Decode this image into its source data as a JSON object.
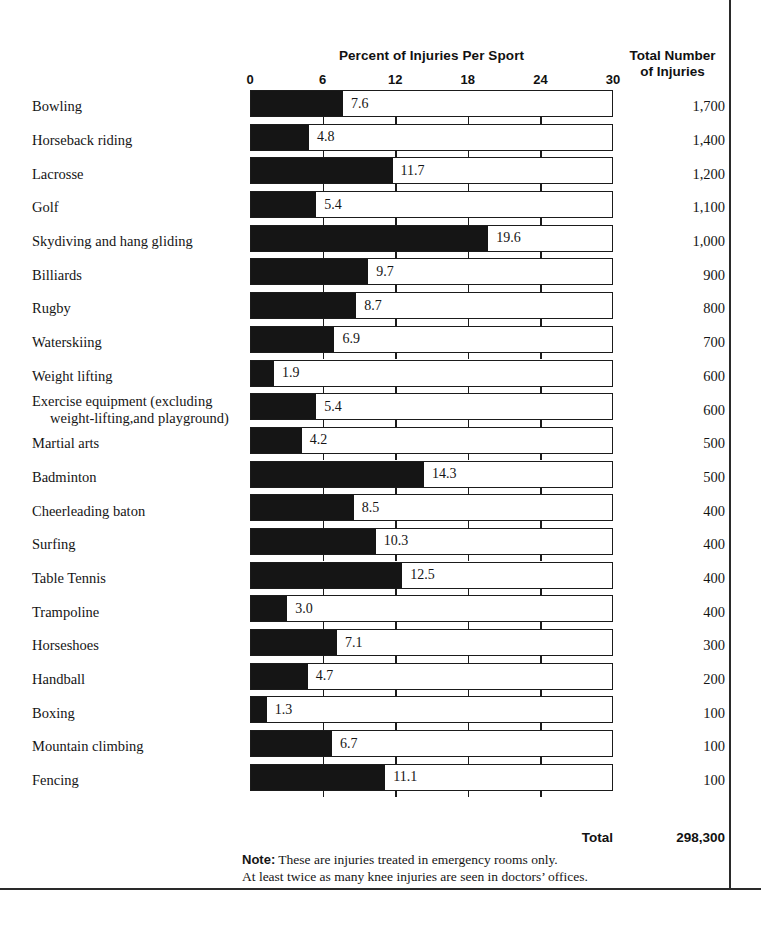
{
  "chart_data": {
    "type": "bar",
    "orientation": "horizontal",
    "title": "Percent of Injuries Per Sport",
    "xlabel": "",
    "ylabel": "",
    "xlim": [
      0,
      30
    ],
    "xticks": [
      0,
      6,
      12,
      18,
      24,
      30
    ],
    "grid": false,
    "legend": null,
    "categories": [
      "Bowling",
      "Horseback riding",
      "Lacrosse",
      "Golf",
      "Skydiving and hang gliding",
      "Billiards",
      "Rugby",
      "Waterskiing",
      "Weight  lifting",
      "Exercise equipment (excluding weight-lifting,and playground)",
      "Martial arts",
      "Badminton",
      "Cheerleading baton",
      "Surfing",
      "Table Tennis",
      "Trampoline",
      "Horseshoes",
      "Handball",
      "Boxing",
      "Mountain climbing",
      "Fencing"
    ],
    "values": [
      7.6,
      4.8,
      11.7,
      5.4,
      19.6,
      9.7,
      8.7,
      6.9,
      1.9,
      5.4,
      4.2,
      14.3,
      8.5,
      10.3,
      12.5,
      3.0,
      7.1,
      4.7,
      1.3,
      6.7,
      11.1
    ],
    "value_labels": [
      "7.6",
      "4.8",
      "11.7",
      "5.4",
      "19.6",
      "9.7",
      "8.7",
      "6.9",
      "1.9",
      "5.4",
      "4.2",
      "14.3",
      "8.5",
      "10.3",
      "12.5",
      "3.0",
      "7.1",
      "4.7",
      "1.3",
      "6.7",
      "11.1"
    ],
    "secondary_series": {
      "name": "Total Number of Injuries",
      "labels": [
        "1,700",
        "1,400",
        "1,200",
        "1,100",
        "1,000",
        "900",
        "800",
        "700",
        "600",
        "600",
        "500",
        "500",
        "400",
        "400",
        "400",
        "400",
        "300",
        "200",
        "100",
        "100",
        "100"
      ],
      "values": [
        1700,
        1400,
        1200,
        1100,
        1000,
        900,
        800,
        700,
        600,
        600,
        500,
        500,
        400,
        400,
        400,
        400,
        300,
        200,
        100,
        100,
        100
      ]
    },
    "colors": {
      "bar_fill": "#151515",
      "bar_track": "#ffffff",
      "bar_border": "#1b1b1b",
      "text": "#151515"
    }
  },
  "header": {
    "chart_title": "Percent of Injuries Per Sport",
    "right_column_title_line1": "Total Number",
    "right_column_title_line2": "of Injuries"
  },
  "axis": {
    "ticks": [
      "0",
      "6",
      "12",
      "18",
      "24",
      "30"
    ]
  },
  "rows": [
    {
      "label": "Bowling",
      "label_line2": "",
      "value": "7.6",
      "total": "1,700"
    },
    {
      "label": "Horseback riding",
      "label_line2": "",
      "value": "4.8",
      "total": "1,400"
    },
    {
      "label": "Lacrosse",
      "label_line2": "",
      "value": "11.7",
      "total": "1,200"
    },
    {
      "label": "Golf",
      "label_line2": "",
      "value": "5.4",
      "total": "1,100"
    },
    {
      "label": "Skydiving and hang gliding",
      "label_line2": "",
      "value": "19.6",
      "total": "1,000"
    },
    {
      "label": "Billiards",
      "label_line2": "",
      "value": "9.7",
      "total": "900"
    },
    {
      "label": "Rugby",
      "label_line2": "",
      "value": "8.7",
      "total": "800"
    },
    {
      "label": "Waterskiing",
      "label_line2": "",
      "value": "6.9",
      "total": "700"
    },
    {
      "label": "Weight  lifting",
      "label_line2": "",
      "value": "1.9",
      "total": "600"
    },
    {
      "label": "Exercise equipment (excluding",
      "label_line2": "weight-lifting,and playground)",
      "value": "5.4",
      "total": "600"
    },
    {
      "label": "Martial arts",
      "label_line2": "",
      "value": "4.2",
      "total": "500"
    },
    {
      "label": "Badminton",
      "label_line2": "",
      "value": "14.3",
      "total": "500"
    },
    {
      "label": "Cheerleading baton",
      "label_line2": "",
      "value": "8.5",
      "total": "400"
    },
    {
      "label": "Surfing",
      "label_line2": "",
      "value": "10.3",
      "total": "400"
    },
    {
      "label": "Table Tennis",
      "label_line2": "",
      "value": "12.5",
      "total": "400"
    },
    {
      "label": "Trampoline",
      "label_line2": "",
      "value": "3.0",
      "total": "400"
    },
    {
      "label": "Horseshoes",
      "label_line2": "",
      "value": "7.1",
      "total": "300"
    },
    {
      "label": "Handball",
      "label_line2": "",
      "value": "4.7",
      "total": "200"
    },
    {
      "label": "Boxing",
      "label_line2": "",
      "value": "1.3",
      "total": "100"
    },
    {
      "label": "Mountain climbing",
      "label_line2": "",
      "value": "6.7",
      "total": "100"
    },
    {
      "label": "Fencing",
      "label_line2": "",
      "value": "11.1",
      "total": "100"
    }
  ],
  "totals": {
    "label": "Total",
    "value": "298,300"
  },
  "note": {
    "head": "Note:",
    "line1": " These are injuries treated in emergency rooms only.",
    "line2": "At least twice as many knee injuries are seen in doctors’ offices."
  }
}
